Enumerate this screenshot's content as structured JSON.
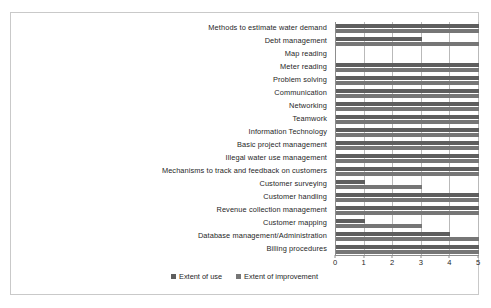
{
  "chart_data": {
    "type": "bar",
    "orientation": "horizontal",
    "title": "",
    "xlabel": "",
    "ylabel": "",
    "xlim": [
      0,
      5
    ],
    "xticks": [
      "0",
      "1",
      "2",
      "3",
      "4",
      "5"
    ],
    "grid": true,
    "legend_position": "bottom-center",
    "categories": [
      "Methods to estimate water demand",
      "Debt management",
      "Map reading",
      "Meter reading",
      "Problem solving",
      "Communication",
      "Networking",
      "Teamwork",
      "Information Technology",
      "Basic project management",
      "Illegal water use management",
      "Mechanisms to track and feedback on customers",
      "Customer surveying",
      "Customer handling",
      "Revenue collection management",
      "Customer mapping",
      "Database management/Administration",
      "Billing procedures"
    ],
    "series": [
      {
        "name": "Extent of use",
        "color": "#5e5e5e",
        "values": [
          5,
          3,
          0,
          5,
          5,
          5,
          5,
          5,
          5,
          5,
          5,
          5,
          1,
          5,
          5,
          1,
          4,
          5
        ]
      },
      {
        "name": "Extent of improvement",
        "color": "#767676",
        "values": [
          5,
          5,
          0,
          5,
          5,
          5,
          5,
          5,
          5,
          5,
          5,
          5,
          3,
          5,
          5,
          3,
          5,
          5
        ]
      }
    ]
  },
  "legend": {
    "items": [
      {
        "label": "Extent of use"
      },
      {
        "label": "Extent of improvement"
      }
    ]
  }
}
